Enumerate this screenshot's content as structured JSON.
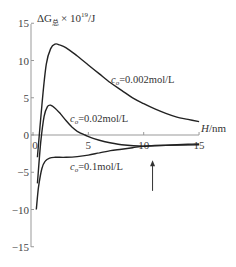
{
  "chart_data": {
    "type": "line",
    "title": "",
    "ylabel": "ΔG总 × 10^19/J",
    "ylabel_parts": {
      "main": "ΔG",
      "sub": "总",
      "mult": "× 10",
      "exp": "19",
      "unit": "/J"
    },
    "xlabel": "H/nm",
    "xlabel_parts": {
      "var": "H",
      "unit": "/nm"
    },
    "xlim": [
      0,
      15
    ],
    "ylim": [
      -15,
      15
    ],
    "xticks": [
      "0",
      "5",
      "10",
      "15"
    ],
    "yticks": [
      "15",
      "10",
      "5",
      "0",
      "−5",
      "−10",
      "−15"
    ],
    "grid": false,
    "legend": "inline annotations",
    "series": [
      {
        "name": "c0=0.002mol/L",
        "label_c": "c",
        "label_sub": "o",
        "label_rest": "=0.002mol/L",
        "x": [
          0.4,
          0.8,
          1.2,
          1.6,
          2.0,
          2.4,
          3,
          4,
          5,
          6,
          7,
          8,
          9,
          10,
          11,
          12,
          13,
          14,
          15
        ],
        "y": [
          -3,
          4,
          9.5,
          11.6,
          12.2,
          12.1,
          11.7,
          10.6,
          9.4,
          8.2,
          7.0,
          6.0,
          5.0,
          4.2,
          3.5,
          2.9,
          2.4,
          2.1,
          1.8
        ]
      },
      {
        "name": "c0=0.02mol/L",
        "label_c": "c",
        "label_sub": "o",
        "label_rest": "=0.02mol/L",
        "x": [
          0.4,
          0.7,
          1.0,
          1.3,
          1.6,
          2.0,
          2.5,
          3,
          3.5,
          4,
          4.7,
          5.5,
          6.5,
          8,
          10,
          12,
          15
        ],
        "y": [
          -6.5,
          -1,
          2.5,
          3.8,
          4.0,
          3.6,
          2.8,
          1.9,
          1.1,
          0.5,
          0,
          -0.5,
          -0.9,
          -1.3,
          -1.5,
          -1.4,
          -1.3
        ]
      },
      {
        "name": "c0=0.1mol/L",
        "label_c": "c",
        "label_sub": "o",
        "label_rest": "=0.1mol/L",
        "x": [
          0.3,
          0.5,
          0.8,
          1.1,
          1.5,
          2,
          3,
          4,
          5,
          6,
          7,
          8,
          9,
          10,
          11,
          12,
          13,
          14,
          15
        ],
        "y": [
          -10,
          -7,
          -4.5,
          -3.5,
          -3.1,
          -3.0,
          -3.0,
          -2.9,
          -2.7,
          -2.4,
          -2.1,
          -1.9,
          -1.7,
          -1.5,
          -1.4,
          -1.35,
          -1.3,
          -1.25,
          -1.2
        ]
      }
    ],
    "annotations": [
      {
        "type": "arrow",
        "x": 10.8,
        "y_from": -7.5,
        "y_to": -3.4,
        "direction": "up"
      }
    ]
  }
}
